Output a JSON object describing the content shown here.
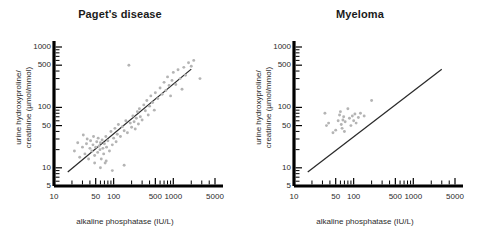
{
  "figure": {
    "panels": [
      {
        "id": "pagets",
        "title": "Paget's disease",
        "xlabel": "alkaline phosphatase  (IU/L)",
        "ylabel_line1": "urine hydroxyproline/",
        "ylabel_line2": "creatinine (µmol/mmol)"
      },
      {
        "id": "myeloma",
        "title": "Myeloma",
        "xlabel": "alkaline phosphatase  (IU/L)",
        "ylabel_line1": "urine hydroxyproline/",
        "ylabel_line2": "creatinine (µmol/mmol)"
      }
    ]
  },
  "chart_data": [
    {
      "type": "scatter",
      "title": "Paget's disease",
      "xlabel": "alkaline phosphatase  (IU/L)",
      "ylabel": "urine hydroxyproline/ creatinine (µmol/mmol)",
      "xscale": "log",
      "yscale": "log",
      "xlim": [
        10,
        5000
      ],
      "ylim": [
        5,
        1000
      ],
      "xticks": [
        10,
        50,
        100,
        500,
        1000,
        5000
      ],
      "xticklabels": [
        "10",
        "50",
        "100",
        "500",
        "1000",
        "5000"
      ],
      "yticks": [
        5,
        10,
        50,
        100,
        500,
        1000
      ],
      "yticklabels": [
        "5",
        "10",
        "50",
        "100",
        "500",
        "1000"
      ],
      "grid": false,
      "legend": null,
      "marker_color": "#b4b4b4",
      "line_color": "#2a2a2a",
      "reference_line": {
        "label": "regression line",
        "x": [
          17,
          2000
        ],
        "y": [
          8.5,
          430
        ]
      },
      "points": [
        [
          22,
          19
        ],
        [
          25,
          26
        ],
        [
          27,
          15
        ],
        [
          30,
          22
        ],
        [
          31,
          35
        ],
        [
          33,
          17
        ],
        [
          35,
          25
        ],
        [
          36,
          30
        ],
        [
          38,
          14
        ],
        [
          40,
          21
        ],
        [
          41,
          28
        ],
        [
          43,
          19
        ],
        [
          45,
          24
        ],
        [
          46,
          33
        ],
        [
          48,
          16
        ],
        [
          50,
          22
        ],
        [
          52,
          27
        ],
        [
          54,
          18
        ],
        [
          55,
          31
        ],
        [
          57,
          23
        ],
        [
          59,
          20
        ],
        [
          60,
          26
        ],
        [
          62,
          14
        ],
        [
          64,
          29
        ],
        [
          66,
          21
        ],
        [
          68,
          17
        ],
        [
          70,
          25
        ],
        [
          72,
          12
        ],
        [
          74,
          33
        ],
        [
          76,
          22
        ],
        [
          80,
          28
        ],
        [
          85,
          19
        ],
        [
          90,
          40
        ],
        [
          95,
          24
        ],
        [
          100,
          31
        ],
        [
          105,
          45
        ],
        [
          110,
          27
        ],
        [
          115,
          36
        ],
        [
          120,
          52
        ],
        [
          130,
          33
        ],
        [
          140,
          48
        ],
        [
          150,
          41
        ],
        [
          160,
          60
        ],
        [
          170,
          38
        ],
        [
          180,
          500
        ],
        [
          190,
          55
        ],
        [
          200,
          47
        ],
        [
          210,
          72
        ],
        [
          220,
          58
        ],
        [
          230,
          44
        ],
        [
          240,
          66
        ],
        [
          250,
          85
        ],
        [
          260,
          53
        ],
        [
          270,
          95
        ],
        [
          280,
          70
        ],
        [
          300,
          62
        ],
        [
          320,
          110
        ],
        [
          340,
          88
        ],
        [
          360,
          130
        ],
        [
          380,
          75
        ],
        [
          400,
          105
        ],
        [
          420,
          155
        ],
        [
          450,
          120
        ],
        [
          480,
          90
        ],
        [
          500,
          175
        ],
        [
          550,
          140
        ],
        [
          600,
          210
        ],
        [
          650,
          165
        ],
        [
          700,
          260
        ],
        [
          750,
          190
        ],
        [
          800,
          320
        ],
        [
          850,
          230
        ],
        [
          900,
          155
        ],
        [
          950,
          280
        ],
        [
          1000,
          380
        ],
        [
          1100,
          240
        ],
        [
          1200,
          420
        ],
        [
          1300,
          300
        ],
        [
          1400,
          200
        ],
        [
          1500,
          460
        ],
        [
          1600,
          340
        ],
        [
          1800,
          550
        ],
        [
          2000,
          480
        ],
        [
          2200,
          600
        ],
        [
          2800,
          300
        ],
        [
          95,
          9
        ],
        [
          150,
          11
        ],
        [
          60,
          10
        ],
        [
          75,
          13
        ],
        [
          48,
          12
        ]
      ]
    },
    {
      "type": "scatter",
      "title": "Myeloma",
      "xlabel": "alkaline phosphatase  (IU/L)",
      "ylabel": "urine hydroxyproline/ creatinine (µmol/mmol)",
      "xscale": "log",
      "yscale": "log",
      "xlim": [
        10,
        5000
      ],
      "ylim": [
        5,
        1000
      ],
      "xticks": [
        10,
        50,
        100,
        500,
        1000,
        5000
      ],
      "xticklabels": [
        "10",
        "50",
        "100",
        "500",
        "1000",
        "5000"
      ],
      "yticks": [
        5,
        10,
        50,
        100,
        500,
        1000
      ],
      "yticklabels": [
        "5",
        "10",
        "50",
        "100",
        "500",
        "1000"
      ],
      "grid": false,
      "legend": null,
      "marker_color": "#b4b4b4",
      "line_color": "#2a2a2a",
      "reference_line": {
        "label": "reference line",
        "x": [
          17,
          3000
        ],
        "y": [
          8.5,
          430
        ]
      },
      "points": [
        [
          33,
          80
        ],
        [
          35,
          50
        ],
        [
          38,
          55
        ],
        [
          45,
          38
        ],
        [
          50,
          42
        ],
        [
          55,
          60
        ],
        [
          58,
          75
        ],
        [
          60,
          85
        ],
        [
          62,
          52
        ],
        [
          64,
          45
        ],
        [
          66,
          62
        ],
        [
          68,
          70
        ],
        [
          70,
          40
        ],
        [
          72,
          58
        ],
        [
          80,
          95
        ],
        [
          85,
          66
        ],
        [
          90,
          50
        ],
        [
          95,
          72
        ],
        [
          100,
          60
        ],
        [
          105,
          78
        ],
        [
          110,
          55
        ],
        [
          120,
          68
        ],
        [
          130,
          80
        ],
        [
          150,
          72
        ],
        [
          200,
          130
        ]
      ]
    }
  ]
}
